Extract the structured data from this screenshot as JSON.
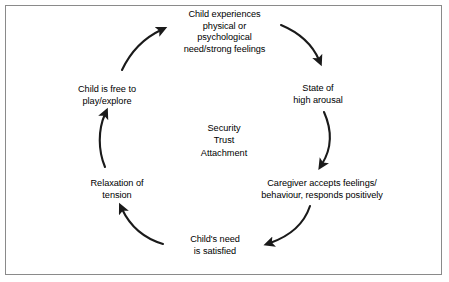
{
  "diagram": {
    "type": "cycle-diagram",
    "background_color": "#ffffff",
    "text_color": "#000000",
    "border_color": "#8a8a8a",
    "arrow_color": "#1a1a1a",
    "center": {
      "lines": [
        "Security",
        "Trust",
        "Attachment"
      ],
      "line1": "Security",
      "line2": "Trust",
      "line3": "Attachment"
    },
    "nodes": [
      {
        "id": "child-experiences-need",
        "position": "top",
        "line1": "Child experiences",
        "line2": "physical or",
        "line3": "psychological",
        "line4": "need/strong feelings"
      },
      {
        "id": "state-of-high-arousal",
        "position": "right-upper",
        "line1": "State of",
        "line2": "high arousal"
      },
      {
        "id": "caregiver-accepts-feelings",
        "position": "right-lower",
        "line1": "Caregiver accepts feelings/",
        "line2": "behaviour, responds positively"
      },
      {
        "id": "childs-need-is-satisfied",
        "position": "bottom",
        "line1": "Child's need",
        "line2": "is satisfied"
      },
      {
        "id": "relaxation-of-tension",
        "position": "left-lower",
        "line1": "Relaxation of",
        "line2": "tension"
      },
      {
        "id": "child-is-free-to-play",
        "position": "left-upper",
        "line1": "Child is free to",
        "line2": "play/explore"
      }
    ],
    "arrows": [
      {
        "id": "arrow-top-to-right",
        "from": "child-experiences-need",
        "to": "state-of-high-arousal"
      },
      {
        "id": "arrow-right-upper-to-right-lower",
        "from": "state-of-high-arousal",
        "to": "caregiver-accepts-feelings"
      },
      {
        "id": "arrow-right-lower-to-bottom",
        "from": "caregiver-accepts-feelings",
        "to": "childs-need-is-satisfied"
      },
      {
        "id": "arrow-bottom-to-left-lower",
        "from": "childs-need-is-satisfied",
        "to": "relaxation-of-tension"
      },
      {
        "id": "arrow-left-lower-to-left-upper",
        "from": "relaxation-of-tension",
        "to": "child-is-free-to-play"
      },
      {
        "id": "arrow-left-upper-to-top",
        "from": "child-is-free-to-play",
        "to": "child-experiences-need"
      }
    ]
  }
}
